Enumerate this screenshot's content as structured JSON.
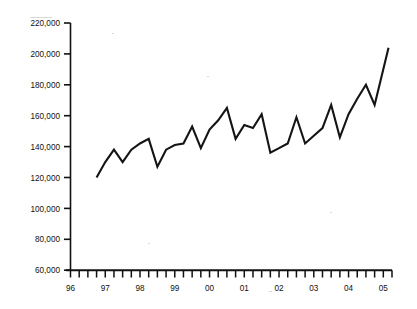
{
  "figure": {
    "has_top_rule": true,
    "background_color": "#ffffff",
    "line_color": "#141414",
    "axis_color": "#111111"
  },
  "chart_data": {
    "type": "line",
    "title": "",
    "subtitle": "",
    "xlabel": "",
    "ylabel": "",
    "xlim": [
      1996.0,
      2005.25
    ],
    "ylim": [
      60000,
      220000
    ],
    "grid": false,
    "legend": false,
    "legend_position": "none",
    "y_ticks": [
      60000,
      80000,
      100000,
      120000,
      140000,
      160000,
      180000,
      200000,
      220000
    ],
    "y_tick_labels": [
      "60,000",
      "80,000",
      "100,000",
      "120,000",
      "140,000",
      "160,000",
      "180,000",
      "200,000",
      "220,000"
    ],
    "x_tick_labels": [
      "96",
      "97",
      "98",
      "99",
      "00",
      "01",
      "02",
      "03",
      "04",
      "05"
    ],
    "x_tick_values": [
      1996,
      1997,
      1998,
      1999,
      2000,
      2001,
      2002,
      2003,
      2004,
      2005
    ],
    "x_minor_interval": "quarterly",
    "series": [
      {
        "name": "series-1",
        "x": [
          1996.75,
          1997.0,
          1997.25,
          1997.5,
          1997.75,
          1998.0,
          1998.25,
          1998.5,
          1998.75,
          1999.0,
          1999.25,
          1999.5,
          1999.75,
          2000.0,
          2000.25,
          2000.5,
          2000.75,
          2001.0,
          2001.25,
          2001.5,
          2001.75,
          2002.0,
          2002.25,
          2002.5,
          2002.75,
          2003.0,
          2003.25,
          2003.5,
          2003.75,
          2004.0,
          2004.25,
          2004.5,
          2004.75,
          2005.0,
          2005.15
        ],
        "values": [
          120000,
          130000,
          138000,
          130000,
          138000,
          142000,
          145000,
          127000,
          138000,
          141000,
          142000,
          153000,
          139000,
          151000,
          157000,
          165000,
          145000,
          154000,
          152000,
          161000,
          136000,
          139000,
          142000,
          159000,
          142000,
          147000,
          152000,
          167000,
          146000,
          161000,
          171000,
          180000,
          167000,
          190000,
          204000
        ]
      }
    ]
  }
}
